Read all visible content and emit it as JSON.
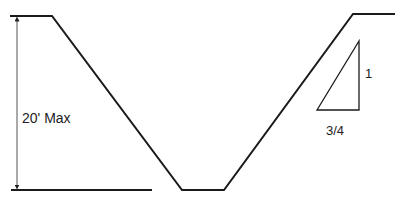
{
  "diagram": {
    "type": "trench-cross-section",
    "labels": {
      "depth": "20' Max",
      "slope_rise": "1",
      "slope_run": "3/4"
    },
    "colors": {
      "line": "#1a1a1a",
      "dimension": "#555555",
      "background": "#ffffff"
    }
  }
}
